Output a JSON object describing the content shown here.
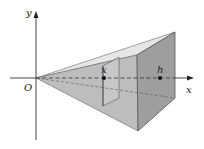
{
  "diagram": {
    "axes": {
      "y_label": "y",
      "x_label": "x",
      "origin_label": "O"
    },
    "points": {
      "x_label": "x",
      "h_label": "h"
    },
    "colors": {
      "top_face": "#e4e4e4",
      "front_lower_face": "#b9b9b9",
      "right_face": "#9c9c9c",
      "slice": "#c9c9c9",
      "edge": "#555555",
      "axis": "#333333",
      "dashed": "#444444"
    }
  }
}
